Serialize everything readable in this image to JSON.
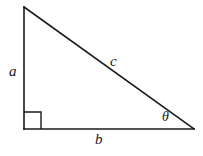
{
  "figure": {
    "kind": "right-triangle-diagram",
    "background_color": "#ffffff",
    "stroke_color": "#1a1a1a",
    "stroke_width": 1.6,
    "canvas": {
      "width": 203,
      "height": 156
    }
  },
  "vertices": {
    "apex": {
      "x": 24,
      "y": 7
    },
    "right_angle": {
      "x": 24,
      "y": 129
    },
    "theta_vertex": {
      "x": 194,
      "y": 129
    }
  },
  "right_angle_marker": {
    "size": 17,
    "x": 24,
    "y": 112
  },
  "labels": {
    "leg_vertical": "a",
    "leg_horizontal": "b",
    "hypotenuse": "c",
    "angle": "θ"
  }
}
